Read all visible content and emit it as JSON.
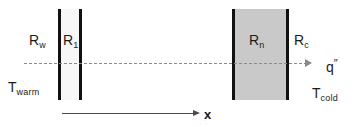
{
  "diagram": {
    "labels": {
      "r_wall": {
        "base": "R",
        "sub": "w"
      },
      "r_one": {
        "base": "R",
        "sub": "1"
      },
      "r_n": {
        "base": "R",
        "sub": "n"
      },
      "r_contact": {
        "base": "R",
        "sub": "c"
      },
      "heat_flux": {
        "base": "q",
        "sup": "″"
      },
      "t_warm": {
        "base": "T",
        "sub": "warm"
      },
      "t_cold": {
        "base": "T",
        "sub": "cold"
      },
      "x_axis": {
        "base": "x"
      }
    },
    "colors": {
      "slab_edge": "#111111",
      "left_slab_fill": "#f7f7f7",
      "right_slab_fill": "#c9c9c9",
      "flux_line": "#8a8a8a",
      "x_axis": "#4a4a4a",
      "text": "#1b1b1b",
      "background": "#ffffff"
    }
  },
  "chart_data": {
    "type": "diagram",
    "elements": [
      {
        "name": "left-slab",
        "label": "R1",
        "kind": "material-layer",
        "fill": "#f7f7f7",
        "x_left": 58,
        "x_right": 82,
        "y_top": 9,
        "y_bottom": 100
      },
      {
        "name": "right-slab",
        "label": "Rn",
        "kind": "material-layer",
        "fill": "#c9c9c9",
        "x_left": 232,
        "x_right": 289,
        "y_top": 9,
        "y_bottom": 100
      }
    ],
    "resistances": [
      "Rw",
      "R1",
      "Rn",
      "Rc"
    ],
    "boundary_temperatures": {
      "left": "Twarm",
      "right": "Tcold"
    },
    "flux_direction": "left-to-right",
    "flux_symbol": "q″",
    "axis": {
      "label": "x",
      "direction": "left-to-right",
      "y": 113
    }
  }
}
